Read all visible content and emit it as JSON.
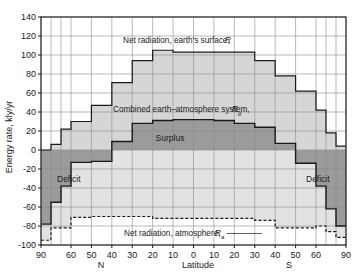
{
  "chart_data": {
    "type": "area",
    "title": "",
    "xlabel": "Latitude",
    "ylabel": "Energy rate, kly/yr",
    "xlim": [
      -90,
      90
    ],
    "ylim": [
      -100,
      140
    ],
    "grid": true,
    "legend": "inline-annotations",
    "x_tick_labels": [
      "90",
      "60",
      "50",
      "40",
      "30",
      "20",
      "10",
      "0",
      "10",
      "20",
      "30",
      "40",
      "50",
      "60",
      "90"
    ],
    "x_tick_values": [
      -90,
      -60,
      -50,
      -40,
      -30,
      -20,
      -10,
      0,
      10,
      20,
      30,
      40,
      50,
      60,
      90
    ],
    "x_minor_values": [
      -80,
      -70,
      70,
      80
    ],
    "hemisphere_labels": {
      "north": "N",
      "south": "S"
    },
    "y_tick_labels": [
      "140",
      "120",
      "100",
      "80",
      "60",
      "40",
      "20",
      "0",
      "-20",
      "-40",
      "-60",
      "-80",
      "-100"
    ],
    "y_tick_values": [
      140,
      120,
      100,
      80,
      60,
      40,
      20,
      0,
      -20,
      -40,
      -60,
      -80,
      -100
    ],
    "band_edges": [
      -90,
      -80,
      -70,
      -60,
      -50,
      -40,
      -30,
      -20,
      -10,
      0,
      10,
      20,
      30,
      40,
      50,
      60,
      70,
      80,
      90
    ],
    "series": [
      {
        "name": "Net radiation, earth's surface, R",
        "label": "Net radiation, earth's surface,",
        "symbol": "R",
        "symbol_sub": "",
        "style": "step-solid",
        "values": [
          0,
          6,
          22,
          30,
          47,
          71,
          94,
          105,
          103,
          103,
          103,
          103,
          94,
          78,
          62,
          42,
          18,
          4
        ]
      },
      {
        "name": "Combined earth-atmosphere system, Rg",
        "label": "Combined earth–atmosphere system,",
        "symbol": "R",
        "symbol_sub": "g",
        "style": "step-solid",
        "values": [
          -78,
          -55,
          -38,
          -13,
          -12,
          9,
          28,
          31,
          32,
          32,
          31,
          28,
          24,
          7,
          -14,
          -38,
          -62,
          -80
        ]
      },
      {
        "name": "Net radiation, atmosphere, Ra",
        "label": "Net radiation, atmosphere,",
        "symbol": "R",
        "symbol_sub": "a",
        "style": "step-dashed",
        "values": [
          -95,
          -82,
          -82,
          -71,
          -70,
          -70,
          -70,
          -72,
          -72,
          -72,
          -72,
          -72,
          -74,
          -82,
          -82,
          -80,
          -86,
          -92
        ]
      }
    ],
    "regions": [
      {
        "label": "Surplus",
        "fill": "#9b9b9b",
        "between": "Rg and zero/positive core"
      },
      {
        "label": "Deficit",
        "fill": "#9b9b9b",
        "side": "north-polar"
      },
      {
        "label": "Deficit",
        "fill": "#9b9b9b",
        "side": "south-polar"
      }
    ],
    "colors": {
      "band_light": "#d6d6d6",
      "band_mid": "#e2e2e2",
      "band_dark": "#9b9b9b",
      "line": "#1a1a1a",
      "grid": "#8c8c8c",
      "axis": "#1a1a1a",
      "background": "#ffffff"
    }
  },
  "axes": {
    "y_title": "Energy rate, kly/yr",
    "x_title": "Latitude",
    "north": "N",
    "south": "S"
  },
  "annotations": {
    "r_label": "Net radiation, earth's surface,",
    "r_symbol": "R",
    "rg_label": "Combined earth–atmosphere system,",
    "rg_symbol": "R",
    "rg_sub": "g",
    "ra_label": "Net radiation, atmosphere,",
    "ra_symbol": "R",
    "ra_sub": "a",
    "surplus": "Surplus",
    "deficit_left": "Deficit",
    "deficit_right": "Deficit"
  }
}
